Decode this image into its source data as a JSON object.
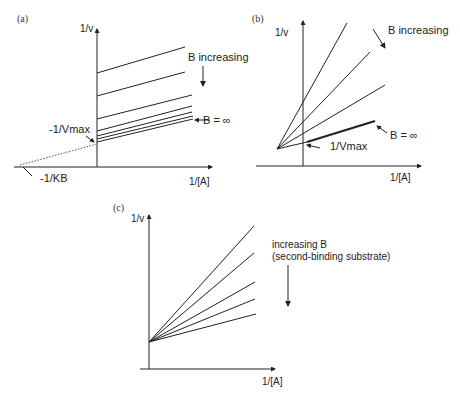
{
  "figure": {
    "panels": [
      {
        "tag": "(a)",
        "y_axis_label": "1/v",
        "x_axis_label": "1/[A]",
        "annotations": {
          "increasing": "B increasing",
          "infinity": "B = ∞",
          "intercept_y": "-1/Vmax",
          "intercept_x": "-1/KB"
        },
        "pattern": "parallel lines",
        "colors": {
          "line": "#222222",
          "dotted": "#555555"
        }
      },
      {
        "tag": "(b)",
        "y_axis_label": "1/v",
        "x_axis_label": "1/[A]",
        "annotations": {
          "increasing": "B increasing",
          "infinity": "B = ∞",
          "intercept_y": "1/Vmax"
        },
        "pattern": "lines converging left of y-axis",
        "colors": {
          "line": "#222222"
        }
      },
      {
        "tag": "(c)",
        "y_axis_label": "1/v",
        "x_axis_label": "1/[A]",
        "annotations": {
          "increasing_line1": "increasing B",
          "increasing_line2": "(second-binding substrate)"
        },
        "pattern": "lines converging on y-axis",
        "colors": {
          "line": "#222222"
        }
      }
    ]
  }
}
